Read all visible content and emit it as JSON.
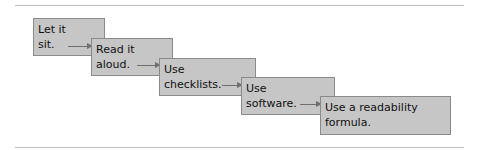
{
  "diagram": {
    "type": "staircase-flow",
    "steps": [
      {
        "line1": "Let it",
        "line2": "sit."
      },
      {
        "line1": "Read it",
        "line2": "aloud."
      },
      {
        "line1": "Use",
        "line2": "checklists."
      },
      {
        "line1": "Use",
        "line2": "software."
      },
      {
        "line1": "Use a readability",
        "line2": "formula."
      }
    ],
    "colors": {
      "box_fill": "#c6c6c6",
      "box_border": "#8a8a8a",
      "arrow": "#707070",
      "rule": "#bdbdbd"
    }
  }
}
